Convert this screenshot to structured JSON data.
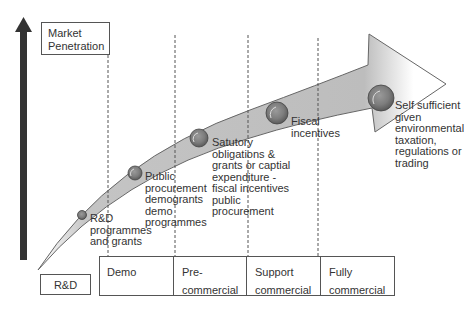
{
  "axis": {
    "y_label": "Market\nPenetration",
    "origin_label": "R&D"
  },
  "stages": [
    {
      "label": "Demo"
    },
    {
      "label": "Pre-\ncommercial"
    },
    {
      "label": "Support\ncommercial"
    },
    {
      "label": "Fully\ncommercial"
    }
  ],
  "milestones": [
    {
      "label": "R&D\nprogrammes\nand grants",
      "size": "small"
    },
    {
      "label": "Public\nprocurement\ndemogrants\ndemo\nprogrammes",
      "size": "medium"
    },
    {
      "label": "Satutory\nobligations &\ngrants or captial\nexpenditure -\nfiscal incentives\npublic\nprocurement",
      "size": "medium"
    },
    {
      "label": "Fiscal\nincentives",
      "size": "large"
    },
    {
      "label": "Self sufficient\ngiven\nenvironmental\ntaxation,\nregulations or\ntrading",
      "size": "large"
    }
  ],
  "colors": {
    "axis_arrow": "#333333",
    "band_fill": "#bdbdbd",
    "outline": "#666666"
  }
}
